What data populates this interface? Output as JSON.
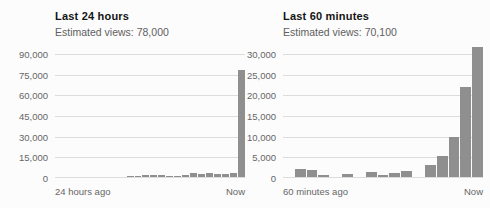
{
  "chart_data": [
    {
      "type": "bar",
      "title": "Last 24 hours",
      "subtitle": "Estimated views: 78,000",
      "estimated_views": "78,000",
      "x_start_label": "24 hours ago",
      "x_end_label": "Now",
      "ylabel": "",
      "xlabel": "",
      "y_ticks": [
        "90,000",
        "75,000",
        "60,000",
        "45,000",
        "30,000",
        "15,000",
        "0"
      ],
      "ylim": [
        0,
        90000
      ],
      "grid": true,
      "legend": false,
      "values": [
        0,
        0,
        0,
        0,
        0,
        0,
        0,
        0,
        0,
        900,
        1000,
        1200,
        1500,
        1500,
        1000,
        900,
        1800,
        2600,
        2000,
        3100,
        2300,
        2100,
        2900,
        78000
      ]
    },
    {
      "type": "bar",
      "title": "Last 60 minutes",
      "subtitle": "Estimated views: 70,100",
      "estimated_views": "70,100",
      "x_start_label": "60 minutes ago",
      "x_end_label": "Now",
      "ylabel": "",
      "xlabel": "",
      "y_ticks": [
        "30,000",
        "25,000",
        "20,000",
        "15,000",
        "10,000",
        "5,000",
        "0"
      ],
      "ylim": [
        0,
        30000
      ],
      "grid": true,
      "legend": false,
      "values": [
        0,
        2000,
        1800,
        500,
        0,
        700,
        0,
        1300,
        500,
        900,
        1400,
        0,
        3000,
        5200,
        9800,
        22000,
        31800
      ]
    }
  ],
  "colors": {
    "bar": "#8f8f8f",
    "gridline": "#dcdcdc",
    "title_text": "#141414",
    "secondary_text": "#606060",
    "background": "#fcfcfc"
  }
}
